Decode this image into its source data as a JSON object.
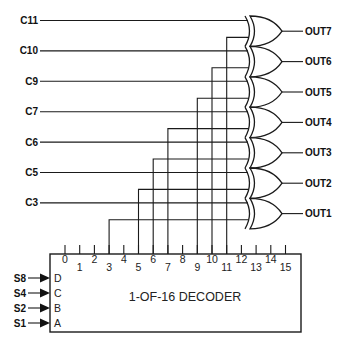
{
  "diagram": {
    "type": "logic-circuit",
    "decoder": {
      "title": "1-OF-16 DECODER",
      "outputs": [
        "0",
        "1",
        "2",
        "3",
        "4",
        "5",
        "6",
        "7",
        "8",
        "9",
        "10",
        "11",
        "12",
        "13",
        "14",
        "15"
      ],
      "inputs": [
        {
          "signal": "S8",
          "pin": "D"
        },
        {
          "signal": "S4",
          "pin": "C"
        },
        {
          "signal": "S2",
          "pin": "B"
        },
        {
          "signal": "S1",
          "pin": "A"
        }
      ]
    },
    "control_inputs": [
      "C11",
      "C10",
      "C9",
      "C7",
      "C6",
      "C5",
      "C3"
    ],
    "gates": [
      {
        "type": "XOR",
        "control": "C11",
        "decoder_pin": "11",
        "output": "OUT7"
      },
      {
        "type": "XOR",
        "control": "C10",
        "decoder_pin": "10",
        "output": "OUT6"
      },
      {
        "type": "XOR",
        "control": "C9",
        "decoder_pin": "9",
        "output": "OUT5"
      },
      {
        "type": "XOR",
        "control": "C7",
        "decoder_pin": "7",
        "output": "OUT4"
      },
      {
        "type": "XOR",
        "control": "C6",
        "decoder_pin": "6",
        "output": "OUT3"
      },
      {
        "type": "XOR",
        "control": "C5",
        "decoder_pin": "5",
        "output": "OUT2"
      },
      {
        "type": "XOR",
        "control": "C3",
        "decoder_pin": "3",
        "output": "OUT1"
      }
    ]
  }
}
